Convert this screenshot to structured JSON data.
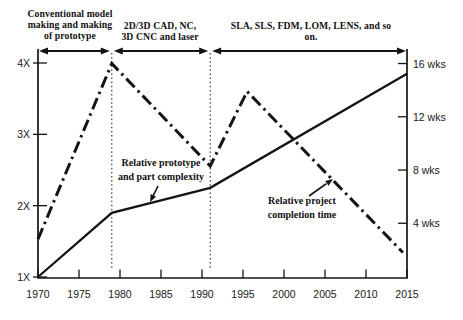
{
  "figure": {
    "background": "#ffffff",
    "ink": "#141414"
  },
  "chart_data": {
    "type": "line",
    "title": "",
    "grid": "off",
    "x_axis": {
      "label": "",
      "ticks": [
        1970,
        1975,
        1980,
        1985,
        1990,
        1995,
        2000,
        2005,
        2010,
        2015
      ],
      "range": [
        1970,
        2015
      ]
    },
    "y_axis_left": {
      "label": "",
      "tick_labels": [
        "1X",
        "2X",
        "3X",
        "4X"
      ],
      "tick_values": [
        1,
        2,
        3,
        4
      ],
      "range": [
        1,
        4.2
      ]
    },
    "y_axis_right": {
      "label": "",
      "tick_labels": [
        "4 wks",
        "8 wks",
        "12 wks",
        "16 wks"
      ],
      "tick_values": [
        4,
        8,
        12,
        16
      ],
      "range": [
        0,
        17
      ]
    },
    "divider_years": [
      1979,
      1991
    ],
    "series": [
      {
        "name": "Relative prototype and part complexity",
        "label_lines": [
          "Relative prototype",
          "and part complexity"
        ],
        "axis": "left",
        "unit": "x-multiplier",
        "line_style": "solid",
        "points": [
          [
            1970,
            1.0
          ],
          [
            1979,
            1.9
          ],
          [
            1991,
            2.25
          ],
          [
            2015,
            3.85
          ]
        ]
      },
      {
        "name": "Relative project completion time",
        "label_lines": [
          "Relative project",
          "completion time"
        ],
        "axis": "right",
        "unit": "weeks",
        "line_style": "dash-dot",
        "points": [
          [
            1970,
            2.8
          ],
          [
            1979,
            16
          ],
          [
            1991,
            8.3
          ],
          [
            1995.5,
            13.9
          ],
          [
            2014.5,
            1.8
          ]
        ]
      }
    ],
    "era_annotations": [
      {
        "label_lines": [
          "Conventional model",
          "making and making",
          "of prototype"
        ],
        "from": 1970,
        "to": 1979
      },
      {
        "label_lines": [
          "2D/3D CAD, NC,",
          "3D CNC and laser"
        ],
        "from": 1979,
        "to": 1991
      },
      {
        "label_lines": [
          "SLA, SLS, FDM, LOM, LENS, and so",
          "on."
        ],
        "from": 1991,
        "to": 2015
      }
    ]
  }
}
